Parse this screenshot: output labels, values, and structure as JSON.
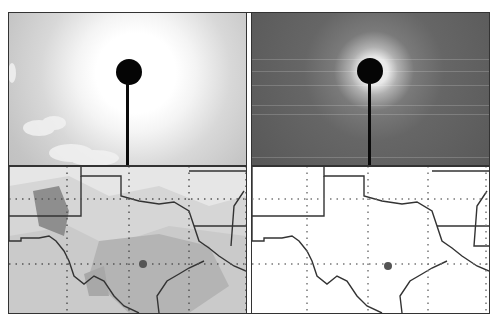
{
  "figure": {
    "panels": [
      {
        "id": "sky-left",
        "description": "Sky image, bright sun aureole with clouds, occulter disk on pole"
      },
      {
        "id": "sky-right",
        "description": "Processed sky image, dark background with occulter disk on pole"
      },
      {
        "id": "map-left",
        "description": "Shaded contour map of Texas and surrounding states with lat/lon grid and site marker"
      },
      {
        "id": "map-right",
        "description": "Outline map of Texas and surrounding states with lat/lon grid and site marker"
      }
    ],
    "colors": {
      "frame": "#333333",
      "occulter": "#050505",
      "marker": "#555555",
      "map_shade_light": "#e6e6e6",
      "map_shade_mid": "#c8c8c8",
      "map_shade_dark": "#8e8e8e"
    }
  }
}
